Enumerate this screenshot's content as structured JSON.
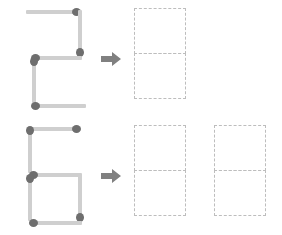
{
  "canvas": {
    "width": 282,
    "height": 235,
    "background": "#ffffff"
  },
  "colors": {
    "match_stick": "#cfcfcf",
    "match_head": "#6e6e6e",
    "arrow": "#808080",
    "dashed_outline": "#bdbdbd"
  },
  "icons": {
    "arrow": "arrow-right-icon"
  },
  "rows": [
    {
      "id": "row-top",
      "source_figure": {
        "name": "matchstick-digit-2",
        "reads_as": "2",
        "match_count": 5,
        "matches": [
          {
            "id": "top-bar",
            "orientation": "horizontal",
            "head": "right",
            "x": 8,
            "y": 4,
            "length": 54
          },
          {
            "id": "upper-right",
            "orientation": "vertical",
            "head": "bottom",
            "x": 58,
            "y": 6,
            "length": 46
          },
          {
            "id": "middle-bar",
            "orientation": "horizontal",
            "head": "left",
            "x": 14,
            "y": 50,
            "length": 50
          },
          {
            "id": "lower-left",
            "orientation": "vertical",
            "head": "top",
            "x": 12,
            "y": 54,
            "length": 46
          },
          {
            "id": "bottom-bar",
            "orientation": "horizontal",
            "head": "left",
            "x": 14,
            "y": 98,
            "length": 54
          }
        ]
      },
      "arrow": {
        "x": 100,
        "y": 50
      },
      "targets": [
        {
          "id": "target-1",
          "name": "digit-slot",
          "x": 134,
          "y": 8
        }
      ],
      "target_count": 1
    },
    {
      "id": "row-bottom",
      "source_figure": {
        "name": "matchstick-digit-6",
        "reads_as": "6",
        "match_count": 5,
        "matches": [
          {
            "id": "top-bar",
            "orientation": "horizontal",
            "head": "right",
            "x": 10,
            "y": 4,
            "length": 52
          },
          {
            "id": "upper-left",
            "orientation": "vertical",
            "head": "top",
            "x": 8,
            "y": 6,
            "length": 46
          },
          {
            "id": "middle-bar",
            "orientation": "horizontal",
            "head": "left",
            "x": 12,
            "y": 50,
            "length": 52
          },
          {
            "id": "lower-left",
            "orientation": "vertical",
            "head": "top",
            "x": 8,
            "y": 54,
            "length": 46
          },
          {
            "id": "lower-right",
            "orientation": "vertical",
            "head": "bottom",
            "x": 58,
            "y": 54,
            "length": 46
          },
          {
            "id": "bottom-bar",
            "orientation": "horizontal",
            "head": "left",
            "x": 12,
            "y": 98,
            "length": 52
          }
        ]
      },
      "arrow": {
        "x": 100,
        "y": 50
      },
      "targets": [
        {
          "id": "target-1",
          "name": "digit-slot",
          "x": 134,
          "y": 8
        },
        {
          "id": "target-2",
          "name": "digit-slot",
          "x": 214,
          "y": 8
        }
      ],
      "target_count": 2
    }
  ]
}
